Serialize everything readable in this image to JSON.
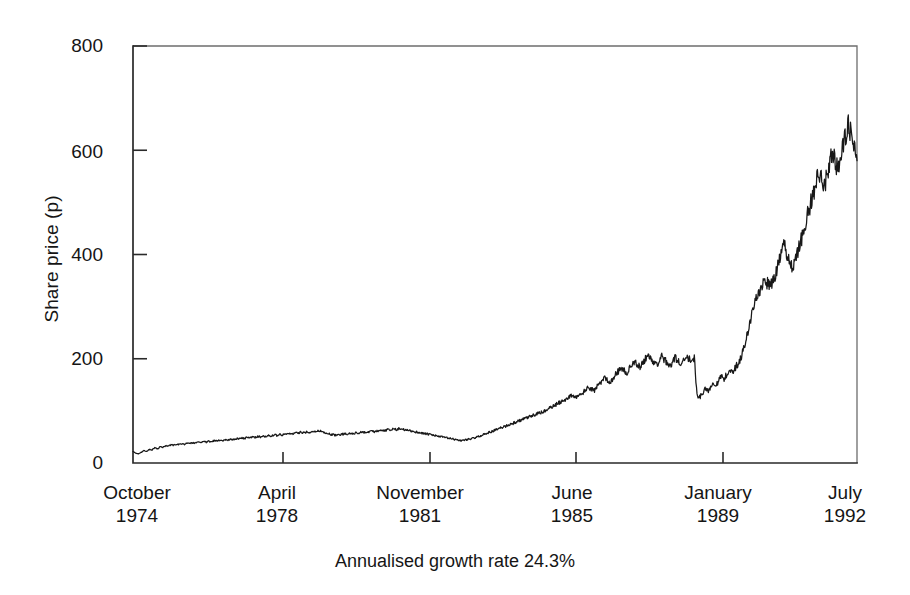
{
  "figure": {
    "caption": "Annualised growth rate 24.3%"
  },
  "chart_data": {
    "type": "line",
    "title": "",
    "subtitle": "",
    "xlabel": "",
    "ylabel": "Share price (p)",
    "annotation": "Annualised growth rate 24.3%",
    "grid": false,
    "legend": "none",
    "ylim": [
      0,
      800
    ],
    "yticks": [
      0,
      200,
      400,
      600,
      800
    ],
    "ytick_labels": [
      "0",
      "200",
      "400",
      "600",
      "800"
    ],
    "xtick_labels": [
      {
        "month": "October",
        "year": "1974"
      },
      {
        "month": "April",
        "year": "1978"
      },
      {
        "month": "November",
        "year": "1981"
      },
      {
        "month": "June",
        "year": "1985"
      },
      {
        "month": "January",
        "year": "1989"
      },
      {
        "month": "July",
        "year": "1992"
      }
    ],
    "x_start": "October 1974",
    "x_end": "July 1992",
    "series": [
      {
        "name": "Share price",
        "units": "p",
        "values": [
          22,
          19,
          17,
          20,
          24,
          22,
          26,
          25,
          29,
          27,
          31,
          30,
          33,
          32,
          35,
          34,
          36,
          35,
          37,
          36,
          38,
          37,
          39,
          38,
          40,
          39,
          41,
          40,
          42,
          41,
          43,
          42,
          44,
          43,
          45,
          44,
          46,
          45,
          47,
          46,
          48,
          47,
          49,
          48,
          50,
          49,
          51,
          50,
          52,
          51,
          53,
          52,
          54,
          53,
          55,
          54,
          56,
          55,
          57,
          56,
          58,
          57,
          59,
          58,
          60,
          59,
          61,
          60,
          62,
          61,
          60,
          58,
          56,
          55,
          54,
          53,
          54,
          55,
          56,
          55,
          57,
          56,
          58,
          57,
          59,
          58,
          60,
          59,
          61,
          60,
          62,
          61,
          63,
          62,
          64,
          63,
          65,
          64,
          66,
          65,
          64,
          63,
          62,
          61,
          60,
          59,
          58,
          57,
          56,
          55,
          54,
          53,
          52,
          51,
          50,
          49,
          48,
          47,
          46,
          45,
          44,
          43,
          44,
          45,
          46,
          47,
          48,
          50,
          52,
          54,
          56,
          58,
          60,
          62,
          64,
          66,
          68,
          70,
          72,
          74,
          76,
          78,
          80,
          82,
          84,
          86,
          88,
          90,
          92,
          94,
          96,
          98,
          100,
          103,
          106,
          109,
          112,
          115,
          118,
          121,
          124,
          127,
          130,
          128,
          126,
          130,
          135,
          140,
          145,
          142,
          138,
          145,
          152,
          158,
          164,
          160,
          155,
          162,
          170,
          176,
          182,
          178,
          172,
          180,
          188,
          194,
          190,
          184,
          192,
          200,
          206,
          200,
          194,
          188,
          196,
          204,
          198,
          192,
          186,
          194,
          202,
          196,
          190,
          198,
          206,
          200,
          194,
          202,
          130,
          126,
          134,
          142,
          138,
          146,
          154,
          150,
          158,
          166,
          162,
          170,
          178,
          174,
          182,
          190,
          200,
          215,
          235,
          258,
          280,
          300,
          318,
          330,
          340,
          350,
          345,
          338,
          348,
          362,
          380,
          400,
          420,
          405,
          390,
          375,
          385,
          400,
          420,
          440,
          460,
          480,
          500,
          520,
          540,
          560,
          545,
          530,
          555,
          580,
          600,
          580,
          560,
          585,
          610,
          630,
          650,
          620,
          600,
          580
        ]
      }
    ]
  },
  "plot_geometry": {
    "left": 133,
    "right": 857,
    "top": 46,
    "bottom": 463,
    "y_min": 0,
    "y_max": 800,
    "xtick_positions": [
      283,
      430,
      576,
      723
    ]
  }
}
